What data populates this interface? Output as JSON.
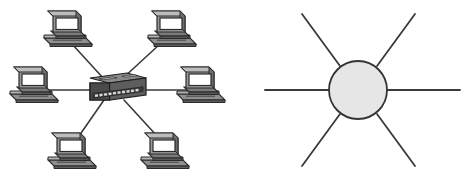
{
  "figure": {
    "width": 470,
    "height": 177,
    "background_color": "#ffffff",
    "panel_count": 2
  },
  "colors": {
    "background": "#ffffff",
    "link_line": "#3a3a3a",
    "device_outline": "#2b2b2b",
    "device_body_dark": "#5a5a5a",
    "device_body_mid": "#7d7d7d",
    "device_body_light": "#a8a8a8",
    "screen_fill": "#ffffff",
    "hub_top": "#8a8a8a",
    "hub_front": "#4a4a4a",
    "hub_port": "#d8d8d8",
    "node_circle_fill": "#e6e6e6",
    "node_circle_stroke": "#333333"
  },
  "panels": [
    {
      "id": "physical-star",
      "name": "physical-star-diagram",
      "label": "Star topology with computers connected to a central hub",
      "center_device": {
        "name": "network-hub",
        "type": "hub",
        "x": 112,
        "y": 88,
        "port_count": 12
      },
      "nodes": [
        {
          "name": "computer-top-left",
          "id": "pc1",
          "x": 66,
          "y": 28
        },
        {
          "name": "computer-top-right",
          "id": "pc2",
          "x": 170,
          "y": 28
        },
        {
          "name": "computer-middle-left",
          "id": "pc3",
          "x": 32,
          "y": 84
        },
        {
          "name": "computer-middle-right",
          "id": "pc4",
          "x": 199,
          "y": 84
        },
        {
          "name": "computer-bottom-left",
          "id": "pc5",
          "x": 70,
          "y": 150
        },
        {
          "name": "computer-bottom-right",
          "id": "pc6",
          "x": 163,
          "y": 150
        }
      ],
      "links": [
        {
          "name": "link-hub-to-pc1",
          "from": "hub",
          "to": "pc1",
          "x1": 104,
          "y1": 79,
          "x2": 72,
          "y2": 44
        },
        {
          "name": "link-hub-to-pc2",
          "from": "hub",
          "to": "pc2",
          "x1": 122,
          "y1": 79,
          "x2": 160,
          "y2": 44
        },
        {
          "name": "link-hub-to-pc3",
          "from": "hub",
          "to": "pc3",
          "x1": 92,
          "y1": 90,
          "x2": 44,
          "y2": 90
        },
        {
          "name": "link-hub-to-pc4",
          "from": "hub",
          "to": "pc4",
          "x1": 133,
          "y1": 90,
          "x2": 188,
          "y2": 90
        },
        {
          "name": "link-hub-to-pc5",
          "from": "hub",
          "to": "pc5",
          "x1": 104,
          "y1": 100,
          "x2": 79,
          "y2": 136
        },
        {
          "name": "link-hub-to-pc6",
          "from": "hub",
          "to": "pc6",
          "x1": 124,
          "y1": 100,
          "x2": 157,
          "y2": 136
        }
      ]
    },
    {
      "id": "logical-star",
      "name": "logical-star-diagram",
      "label": "Abstract star topology: central node with six radiating links",
      "center_node": {
        "name": "central-node",
        "cx": 123,
        "cy": 90,
        "r": 29,
        "fill": "#e6e6e6",
        "stroke": "#333333"
      },
      "spokes": [
        {
          "name": "spoke-west",
          "x1": 30,
          "y1": 90,
          "x2": 96,
          "y2": 90
        },
        {
          "name": "spoke-east",
          "x1": 150,
          "y1": 90,
          "x2": 225,
          "y2": 90
        },
        {
          "name": "spoke-north-west",
          "x1": 67,
          "y1": 14,
          "x2": 105,
          "y2": 66
        },
        {
          "name": "spoke-north-east",
          "x1": 180,
          "y1": 14,
          "x2": 142,
          "y2": 66
        },
        {
          "name": "spoke-south-west",
          "x1": 67,
          "y1": 166,
          "x2": 105,
          "y2": 114
        },
        {
          "name": "spoke-south-east",
          "x1": 180,
          "y1": 166,
          "x2": 142,
          "y2": 114
        }
      ]
    }
  ]
}
